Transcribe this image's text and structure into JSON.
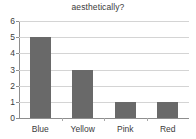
{
  "chart_data": {
    "type": "bar",
    "title": "aesthetically?",
    "xlabel": "",
    "ylabel": "",
    "categories": [
      "Blue",
      "Yellow",
      "Pink",
      "Red"
    ],
    "values": [
      5,
      3,
      1,
      1
    ],
    "ylim": [
      0,
      6
    ],
    "y_ticks": [
      0,
      1,
      2,
      3,
      4,
      5,
      6
    ],
    "y_tick_labels": [
      "0",
      "1",
      "2",
      "3",
      "4",
      "5",
      "6"
    ],
    "grid": true,
    "legend": false,
    "legend_position": "none",
    "bar_color": "#696969",
    "gridline_color": "#d4d4d4",
    "axis_color": "#8e8e8e",
    "text_color": "#3b3b3b",
    "background_color": "#ffffff"
  }
}
